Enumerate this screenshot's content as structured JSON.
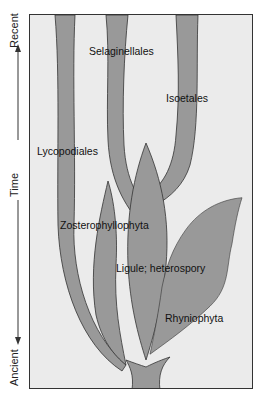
{
  "axis": {
    "title": "Time",
    "top_label": "Recent",
    "bottom_label": "Ancient"
  },
  "clades": {
    "selaginellales": "Selaginellales",
    "isoetales": "Isoetales",
    "lycopodiales": "Lycopodiales",
    "zosterophyllophyta": "Zosterophyllophyta",
    "ligule": "Ligule; heterospory",
    "rhyniophyta": "Rhyniophyta"
  },
  "colors": {
    "background": "#ebebeb",
    "branch_fill": "#999999",
    "outline": "#333333"
  }
}
